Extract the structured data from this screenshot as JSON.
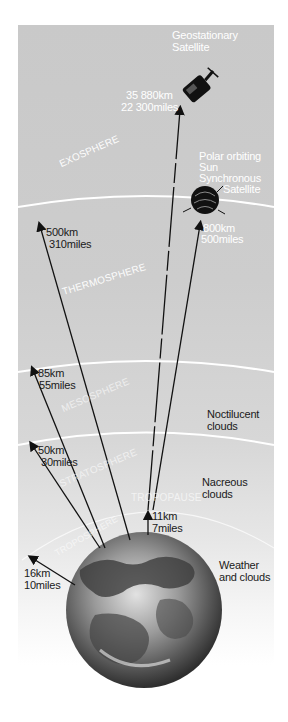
{
  "diagram": {
    "layers": [
      {
        "name": "EXOSPHERE"
      },
      {
        "name": "THERMOSPHERE"
      },
      {
        "name": "MESOSPHERE"
      },
      {
        "name": "STRATOSPHERE"
      },
      {
        "name": "TROPOPAUSE"
      },
      {
        "name": "TROPOSPHERE"
      }
    ],
    "altitudes": [
      {
        "km": "500km",
        "miles": "310miles"
      },
      {
        "km": "85km",
        "miles": "55miles"
      },
      {
        "km": "50km",
        "miles": "30miles"
      },
      {
        "km": "16km",
        "miles": "10miles"
      },
      {
        "km": "11km",
        "miles": "7miles"
      },
      {
        "km": "800km",
        "miles": "500miles"
      },
      {
        "km": "35 880km",
        "miles": "22 300miles"
      }
    ],
    "satellites": {
      "geostationary": {
        "line1": "Geostationary",
        "line2": "Satellite"
      },
      "polar": {
        "line1": "Polar orbiting",
        "line2": "Sun",
        "line3": "Synchronous",
        "line4": "Satellite"
      }
    },
    "phenomena": {
      "noctilucent": {
        "line1": "Noctilucent",
        "line2": "clouds"
      },
      "nacreous": {
        "line1": "Nacreous",
        "line2": "clouds"
      },
      "weather": {
        "line1": "Weather",
        "line2": "and clouds"
      }
    },
    "colors": {
      "sky_gray": "#cbcbcb",
      "boundary": "#ffffff",
      "arrow": "#111111",
      "earth_dark": "#3a3a3a",
      "earth_light": "#d8d8d8"
    }
  }
}
